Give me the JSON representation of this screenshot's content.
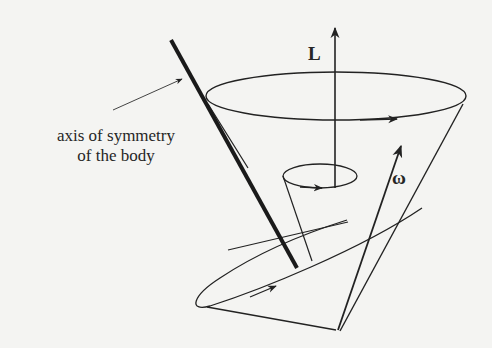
{
  "figure": {
    "labels": {
      "angular_momentum": "L",
      "angular_velocity": "ω",
      "axis_line1": "axis of symmetry",
      "axis_line2": "of the body"
    },
    "elements": [
      {
        "name": "space-cone",
        "description": "large fixed cone around L"
      },
      {
        "name": "body-cone",
        "description": "tilted cone rolling on the space cone"
      },
      {
        "name": "small-cone",
        "description": "small cone traced by symmetry axis around L"
      },
      {
        "name": "L-vector",
        "description": "vertical angular momentum arrow"
      },
      {
        "name": "omega-vector",
        "description": "angular velocity arrow along contact line"
      },
      {
        "name": "symmetry-axis",
        "description": "thick line, axis of symmetry of the body"
      }
    ],
    "colors": {
      "background": "#f4f4f2",
      "ink": "#222222",
      "bleed_text": "#e6e6e4"
    }
  }
}
